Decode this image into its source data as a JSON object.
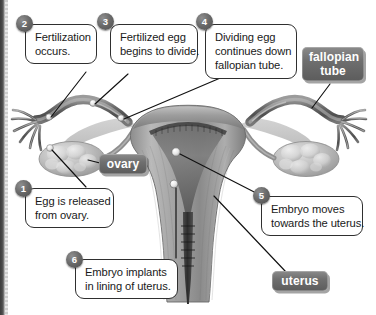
{
  "figure": {
    "kind": "anatomical-diagram",
    "background_color": "#ffffff",
    "line_color": "#1a1a1a",
    "chip_color": "#6f6f6f",
    "badge_color": "#5c5c5c"
  },
  "callouts": [
    {
      "number": "1",
      "name": "egg-released",
      "lines": [
        "Egg is released",
        "from ovary."
      ]
    },
    {
      "number": "2",
      "name": "fertilization",
      "lines": [
        "Fertilization",
        "occurs."
      ]
    },
    {
      "number": "3",
      "name": "egg-divides",
      "lines": [
        "Fertilized egg",
        "begins to divide."
      ]
    },
    {
      "number": "4",
      "name": "egg-travels",
      "lines": [
        "Dividing egg",
        "continues down",
        "fallopian tube."
      ]
    },
    {
      "number": "5",
      "name": "embryo-moves",
      "lines": [
        "Embryo moves",
        "towards the uterus."
      ]
    },
    {
      "number": "6",
      "name": "embryo-implants",
      "lines": [
        "Embryo implants",
        "in lining of uterus."
      ]
    }
  ],
  "structure_labels": [
    {
      "name": "fallopian-tube",
      "lines": [
        "fallopian",
        "tube"
      ]
    },
    {
      "name": "ovary",
      "lines": [
        "ovary"
      ]
    },
    {
      "name": "uterus",
      "lines": [
        "uterus"
      ]
    }
  ]
}
